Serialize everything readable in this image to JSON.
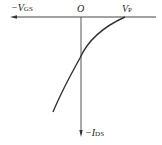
{
  "diagram": {
    "type": "transfer-characteristic",
    "labels": {
      "x_axis": {
        "prefix": "−V",
        "sub": "GS"
      },
      "origin": "O",
      "pinch_off": {
        "main": "V",
        "sub": "P"
      },
      "y_axis": {
        "prefix": "−I",
        "sub": "DS"
      }
    },
    "colors": {
      "line": "#333333",
      "background": "#ffffff"
    }
  }
}
